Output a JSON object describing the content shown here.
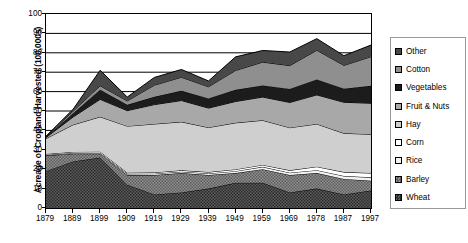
{
  "chart_data": {
    "type": "area",
    "title": "",
    "xlabel": "",
    "ylabel": "Acreage of Cropland Harvested (100,000s)",
    "ylim": [
      0,
      100
    ],
    "yticks": [
      0,
      10,
      20,
      30,
      40,
      50,
      60,
      70,
      80,
      90,
      100
    ],
    "grid": true,
    "legend_position": "right",
    "stacked": true,
    "stack_order_bottom_to_top": [
      "Wheat",
      "Barley",
      "Rice",
      "Corn",
      "Hay",
      "Fruit & Nuts",
      "Vegetables",
      "Cotton",
      "Other"
    ],
    "categories": [
      "1879",
      "1889",
      "1899",
      "1909",
      "1919",
      "1929",
      "1939",
      "1949",
      "1959",
      "1969",
      "1978",
      "1987",
      "1997"
    ],
    "series": [
      {
        "name": "Wheat",
        "color": "#6e6e6e",
        "pattern": "checker-dark",
        "values": [
          19,
          24,
          26,
          12,
          7,
          8,
          10,
          13,
          13,
          8,
          10,
          7,
          9
        ]
      },
      {
        "name": "Barley",
        "color": "#8a8a8a",
        "pattern": "checker-mid",
        "values": [
          8,
          4,
          2,
          5,
          10,
          10,
          7,
          5,
          7,
          9,
          8,
          8,
          5
        ]
      },
      {
        "name": "Rice",
        "color": "#f2f2f2",
        "pattern": "solid",
        "values": [
          0.3,
          0.4,
          0.4,
          0.6,
          0.7,
          0.7,
          0.8,
          1.0,
          1.2,
          1.2,
          1.5,
          1.5,
          1.8
        ]
      },
      {
        "name": "Corn",
        "color": "#ffffff",
        "pattern": "solid",
        "values": [
          0.5,
          0.5,
          0.6,
          0.6,
          0.6,
          0.7,
          0.7,
          0.9,
          1.0,
          1.2,
          1.8,
          2.0,
          2.2
        ]
      },
      {
        "name": "Hay",
        "color": "#cfcfcf",
        "pattern": "solid",
        "values": [
          8,
          14,
          18,
          24,
          25,
          25,
          23,
          24,
          23,
          22,
          22,
          20,
          20
        ]
      },
      {
        "name": "Fruit & Nuts",
        "color": "#a8a8a8",
        "pattern": "solid",
        "values": [
          0.5,
          4,
          9,
          8,
          10,
          11,
          10,
          11,
          12,
          13,
          15,
          16,
          16
        ]
      },
      {
        "name": "Vegetables",
        "color": "#1c1c1c",
        "pattern": "solid",
        "values": [
          0.3,
          2,
          5,
          3,
          4,
          5,
          5,
          6,
          6,
          7,
          8,
          7,
          9
        ]
      },
      {
        "name": "Cotton",
        "color": "#8f8f8f",
        "pattern": "solid",
        "values": [
          0.2,
          1,
          2,
          2,
          6,
          7,
          6,
          10,
          12,
          12,
          15,
          12,
          15
        ]
      },
      {
        "name": "Other",
        "color": "#484848",
        "pattern": "solid",
        "values": [
          0.2,
          1,
          8,
          2,
          4,
          4,
          3,
          7,
          6,
          7,
          6,
          5,
          6
        ]
      }
    ],
    "legend_entries": [
      {
        "label": "Other",
        "swatch": "#484848"
      },
      {
        "label": "Cotton",
        "swatch": "#8f8f8f"
      },
      {
        "label": "Vegetables",
        "swatch": "#1c1c1c"
      },
      {
        "label": "Fruit & Nuts",
        "swatch": "#a8a8a8"
      },
      {
        "label": "Hay",
        "swatch": "#cfcfcf"
      },
      {
        "label": "Corn",
        "swatch": "#ffffff"
      },
      {
        "label": "Rice",
        "swatch": "#f2f2f2"
      },
      {
        "label": "Barley",
        "swatch": "#8a8a8a"
      },
      {
        "label": "Wheat",
        "swatch": "#6e6e6e"
      }
    ]
  }
}
